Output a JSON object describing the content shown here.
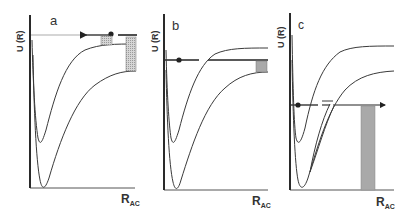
{
  "figure": {
    "panels": [
      {
        "id": "a",
        "label": "a",
        "y_axis_label": "U (R)",
        "x_axis_label": "R",
        "x_axis_subscript": "AC"
      },
      {
        "id": "b",
        "label": "b",
        "y_axis_label": "U (R)",
        "x_axis_label": "R",
        "x_axis_subscript": "AC"
      },
      {
        "id": "c",
        "label": "c",
        "y_axis_label": "U (R)",
        "x_axis_label": "R",
        "x_axis_subscript": "AC"
      }
    ],
    "colors": {
      "line": "#333333",
      "shade": "#b8b8b8",
      "background": "#ffffff"
    }
  }
}
